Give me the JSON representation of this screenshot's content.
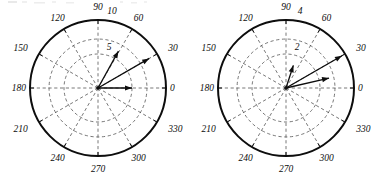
{
  "figure": {
    "background_color": "#ffffff",
    "line_color": "#0d0d0d",
    "grid_color": "#555555",
    "panel_count": 2
  },
  "chart_data": [
    {
      "type": "polar-vector",
      "name": "left-polar-plot",
      "title": "",
      "angle_unit": "degrees",
      "angle_ticks": [
        0,
        30,
        60,
        90,
        120,
        150,
        180,
        210,
        240,
        270,
        300,
        330
      ],
      "angle_tick_labels": [
        "0",
        "30",
        "60",
        "90",
        "120",
        "150",
        "180",
        "210",
        "240",
        "270",
        "300",
        "330"
      ],
      "radial_ticks": [
        5,
        10
      ],
      "radial_tick_labels": [
        "5",
        "10"
      ],
      "rlim": [
        0,
        10
      ],
      "grid": true,
      "legend": "none",
      "vectors": [
        {
          "angle_deg": 0,
          "r": 5.0,
          "label": ""
        },
        {
          "angle_deg": 30,
          "r": 8.7,
          "label": ""
        },
        {
          "angle_deg": 61,
          "r": 6.2,
          "label": ""
        }
      ]
    },
    {
      "type": "polar-vector",
      "name": "right-polar-plot",
      "title": "",
      "angle_unit": "degrees",
      "angle_ticks": [
        0,
        30,
        60,
        90,
        120,
        150,
        180,
        210,
        240,
        270,
        300,
        330
      ],
      "angle_tick_labels": [
        "0",
        "30",
        "60",
        "90",
        "120",
        "150",
        "180",
        "210",
        "240",
        "270",
        "300",
        "330"
      ],
      "radial_ticks": [
        2,
        4
      ],
      "radial_tick_labels": [
        "2",
        "4"
      ],
      "rlim": [
        0,
        4
      ],
      "grid": true,
      "legend": "none",
      "vectors": [
        {
          "angle_deg": 13,
          "r": 2.6,
          "label": ""
        },
        {
          "angle_deg": 30,
          "r": 3.8,
          "label": ""
        },
        {
          "angle_deg": 72,
          "r": 1.4,
          "label": ""
        }
      ]
    }
  ]
}
